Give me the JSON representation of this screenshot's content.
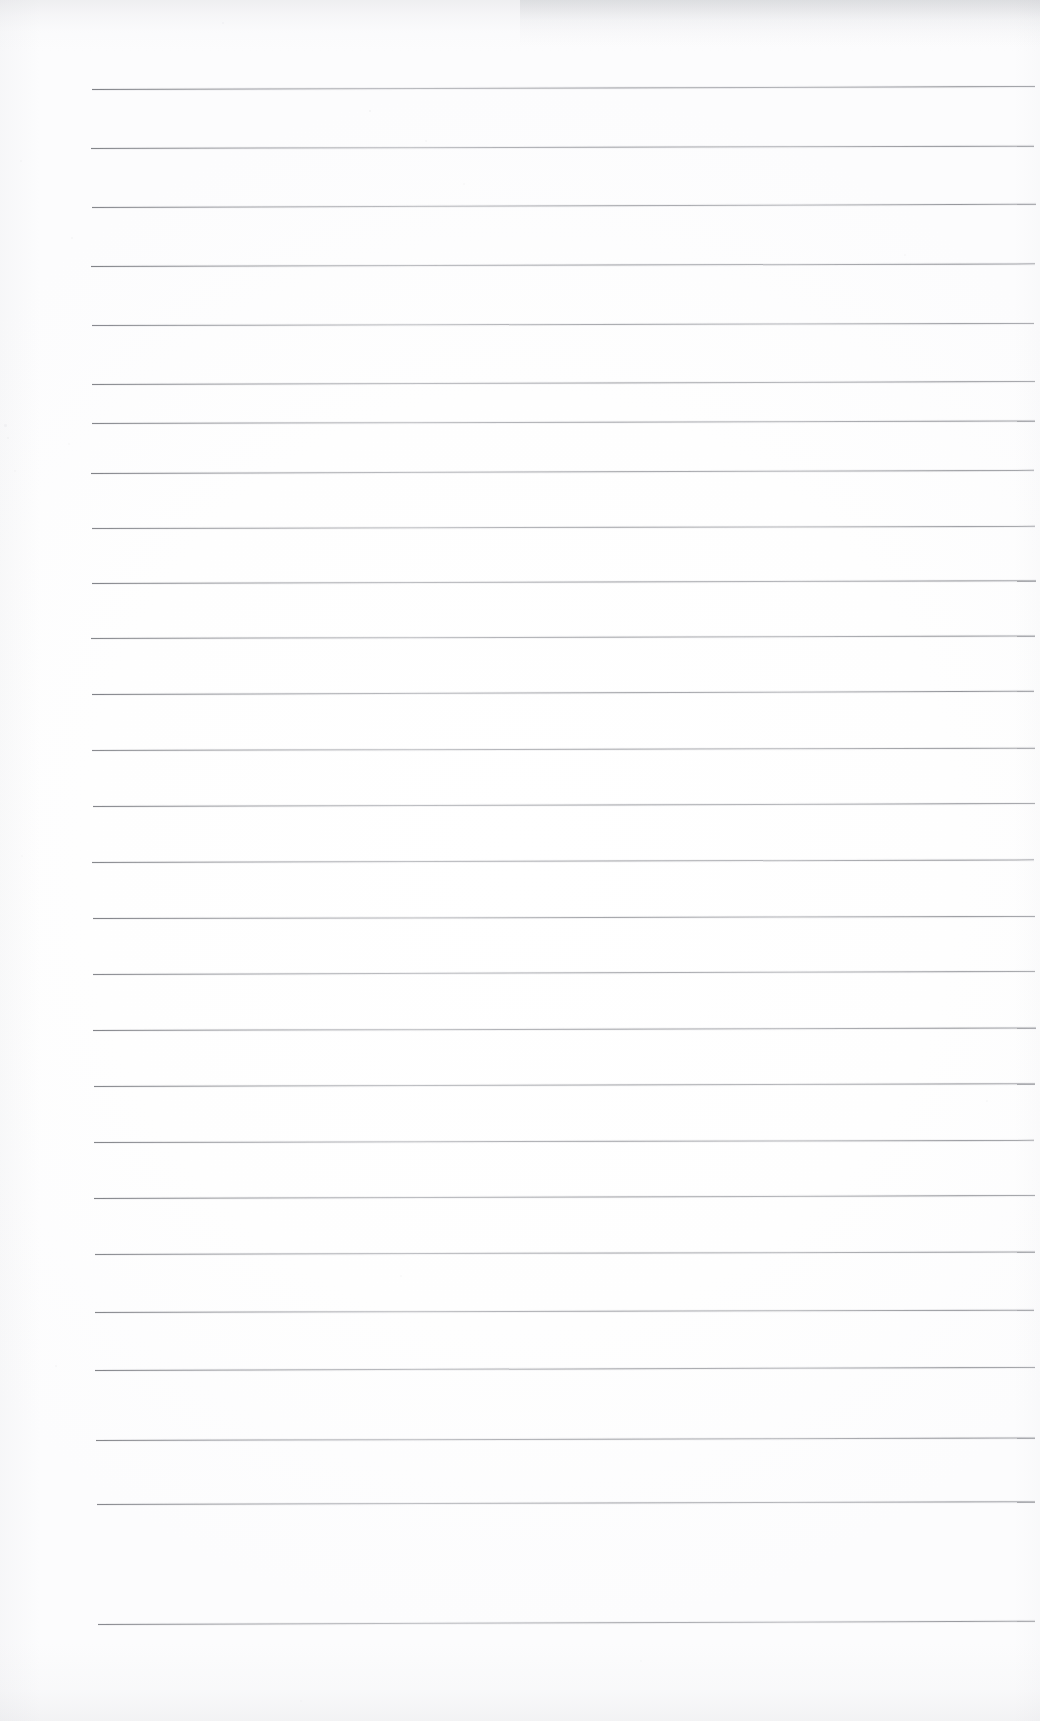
{
  "document": {
    "kind": "scanned-lined-paper",
    "title": "Blank ruled notebook page",
    "content_text": "",
    "page_width": 1040,
    "page_height": 1721,
    "background_color": "#ffffff",
    "rule_color": "#8a8c92",
    "rule_count": 27,
    "rule_thickness_px": 1.25,
    "rule_spacing_px": 59,
    "first_rule_y": 89,
    "last_rule_y": 1624,
    "left_margin_px": 92,
    "right_margin_px": 1035,
    "has_vertical_margin_rule": false,
    "has_handwriting": false,
    "has_header_text": false,
    "has_page_number": false
  },
  "rules": [
    {
      "index": 1,
      "y": 89,
      "x_start": 92,
      "x_end": 1035,
      "tilt_deg": -0.18,
      "opacity": 0.95
    },
    {
      "index": 2,
      "y": 148,
      "x_start": 91,
      "x_end": 1034,
      "tilt_deg": -0.14,
      "opacity": 0.92
    },
    {
      "index": 3,
      "y": 207,
      "x_start": 92,
      "x_end": 1036,
      "tilt_deg": -0.2,
      "opacity": 0.9
    },
    {
      "index": 4,
      "y": 266,
      "x_start": 91,
      "x_end": 1035,
      "tilt_deg": -0.16,
      "opacity": 0.93
    },
    {
      "index": 5,
      "y": 325,
      "x_start": 92,
      "x_end": 1034,
      "tilt_deg": -0.12,
      "opacity": 0.88
    },
    {
      "index": 6,
      "y": 384,
      "x_start": 92,
      "x_end": 1035,
      "tilt_deg": -0.18,
      "opacity": 0.91
    },
    {
      "index": 7,
      "y": 423,
      "x_start": 92,
      "x_end": 1035,
      "tilt_deg": -0.15,
      "opacity": 0.9
    },
    {
      "index": 8,
      "y": 473,
      "x_start": 91,
      "x_end": 1034,
      "tilt_deg": -0.19,
      "opacity": 0.93
    },
    {
      "index": 9,
      "y": 528,
      "x_start": 92,
      "x_end": 1035,
      "tilt_deg": -0.13,
      "opacity": 0.89
    },
    {
      "index": 10,
      "y": 583,
      "x_start": 92,
      "x_end": 1036,
      "tilt_deg": -0.17,
      "opacity": 0.92
    },
    {
      "index": 11,
      "y": 638,
      "x_start": 91,
      "x_end": 1035,
      "tilt_deg": -0.15,
      "opacity": 0.9
    },
    {
      "index": 12,
      "y": 694,
      "x_start": 92,
      "x_end": 1034,
      "tilt_deg": -0.2,
      "opacity": 0.94
    },
    {
      "index": 13,
      "y": 750,
      "x_start": 92,
      "x_end": 1035,
      "tilt_deg": -0.14,
      "opacity": 0.88
    },
    {
      "index": 14,
      "y": 806,
      "x_start": 93,
      "x_end": 1035,
      "tilt_deg": -0.18,
      "opacity": 0.91
    },
    {
      "index": 15,
      "y": 862,
      "x_start": 92,
      "x_end": 1034,
      "tilt_deg": -0.16,
      "opacity": 0.9
    },
    {
      "index": 16,
      "y": 918,
      "x_start": 93,
      "x_end": 1035,
      "tilt_deg": -0.12,
      "opacity": 0.93
    },
    {
      "index": 17,
      "y": 974,
      "x_start": 93,
      "x_end": 1035,
      "tilt_deg": -0.19,
      "opacity": 0.89
    },
    {
      "index": 18,
      "y": 1030,
      "x_start": 93,
      "x_end": 1036,
      "tilt_deg": -0.15,
      "opacity": 0.92
    },
    {
      "index": 19,
      "y": 1086,
      "x_start": 94,
      "x_end": 1035,
      "tilt_deg": -0.17,
      "opacity": 0.9
    },
    {
      "index": 20,
      "y": 1142,
      "x_start": 94,
      "x_end": 1034,
      "tilt_deg": -0.13,
      "opacity": 0.91
    },
    {
      "index": 21,
      "y": 1198,
      "x_start": 94,
      "x_end": 1035,
      "tilt_deg": -0.18,
      "opacity": 0.93
    },
    {
      "index": 22,
      "y": 1254,
      "x_start": 95,
      "x_end": 1035,
      "tilt_deg": -0.16,
      "opacity": 0.89
    },
    {
      "index": 23,
      "y": 1312,
      "x_start": 95,
      "x_end": 1034,
      "tilt_deg": -0.14,
      "opacity": 0.9
    },
    {
      "index": 24,
      "y": 1370,
      "x_start": 95,
      "x_end": 1035,
      "tilt_deg": -0.19,
      "opacity": 0.92
    },
    {
      "index": 25,
      "y": 1440,
      "x_start": 96,
      "x_end": 1035,
      "tilt_deg": -0.15,
      "opacity": 0.91
    },
    {
      "index": 26,
      "y": 1504,
      "x_start": 97,
      "x_end": 1035,
      "tilt_deg": -0.17,
      "opacity": 0.89
    },
    {
      "index": 27,
      "y": 1624,
      "x_start": 98,
      "x_end": 1035,
      "tilt_deg": -0.2,
      "opacity": 0.88
    }
  ],
  "artifacts": {
    "specks": [
      {
        "x": 222,
        "y": 22,
        "size": 2.0,
        "opacity": 0.22
      },
      {
        "x": 369,
        "y": 110,
        "size": 2.4,
        "opacity": 0.3
      },
      {
        "x": 425,
        "y": 140,
        "size": 1.8,
        "opacity": 0.2
      },
      {
        "x": 20,
        "y": 160,
        "size": 2.0,
        "opacity": 0.18
      },
      {
        "x": 463,
        "y": 183,
        "size": 1.6,
        "opacity": 0.16
      },
      {
        "x": 71,
        "y": 237,
        "size": 2.1,
        "opacity": 0.19
      },
      {
        "x": 904,
        "y": 254,
        "size": 1.7,
        "opacity": 0.17
      },
      {
        "x": 4,
        "y": 424,
        "size": 2.6,
        "opacity": 0.22
      },
      {
        "x": 7,
        "y": 437,
        "size": 2.2,
        "opacity": 0.2
      },
      {
        "x": 68,
        "y": 443,
        "size": 2.0,
        "opacity": 0.18
      },
      {
        "x": 14,
        "y": 470,
        "size": 1.8,
        "opacity": 0.16
      },
      {
        "x": 21,
        "y": 855,
        "size": 2.0,
        "opacity": 0.17
      },
      {
        "x": 400,
        "y": 1275,
        "size": 1.9,
        "opacity": 0.18
      },
      {
        "x": 55,
        "y": 1365,
        "size": 2.2,
        "opacity": 0.19
      },
      {
        "x": 986,
        "y": 1100,
        "size": 1.7,
        "opacity": 0.15
      },
      {
        "x": 640,
        "y": 1660,
        "size": 2.0,
        "opacity": 0.14
      },
      {
        "x": 300,
        "y": 1700,
        "size": 1.8,
        "opacity": 0.13
      }
    ]
  }
}
